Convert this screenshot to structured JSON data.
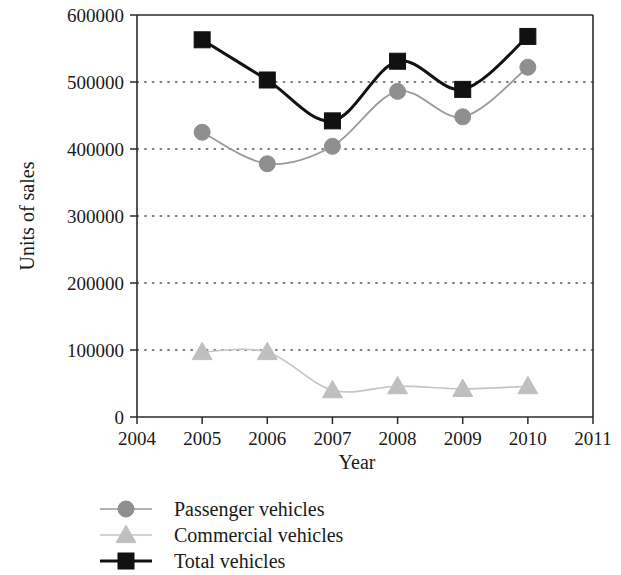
{
  "chart_data": {
    "type": "line",
    "title": "",
    "xlabel": "Year",
    "ylabel": "Units of sales",
    "x": [
      2005,
      2006,
      2007,
      2008,
      2009,
      2010
    ],
    "xticks": [
      2004,
      2005,
      2006,
      2007,
      2008,
      2009,
      2010,
      2011
    ],
    "xtick_labels": [
      "2004",
      "2005",
      "2006",
      "2007",
      "2008",
      "2009",
      "2010",
      "2011"
    ],
    "yticks": [
      0,
      100000,
      200000,
      300000,
      400000,
      500000,
      600000
    ],
    "ytick_labels": [
      "0",
      "100000",
      "200000",
      "300000",
      "400000",
      "500000",
      "600000"
    ],
    "xlim": [
      2004,
      2011
    ],
    "ylim": [
      0,
      600000
    ],
    "grid": "horizontal-dotted",
    "legend_position": "below-axes-left",
    "smoothing": "spline",
    "series": [
      {
        "name": "Passenger vehicles",
        "marker": "circle",
        "color": "#8f8f8f",
        "line_color": "#9a9a9a",
        "values": [
          425000,
          378000,
          404000,
          486000,
          448000,
          522000
        ]
      },
      {
        "name": "Commercial vehicles",
        "marker": "triangle",
        "color": "#bfbfbf",
        "line_color": "#c4c4c4",
        "values": [
          97000,
          97000,
          40000,
          46000,
          42000,
          46000
        ]
      },
      {
        "name": "Total vehicles",
        "marker": "square",
        "color": "#111111",
        "line_color": "#111111",
        "values": [
          563000,
          503000,
          442000,
          531000,
          489000,
          568000
        ]
      }
    ]
  },
  "legend": {
    "items": [
      {
        "label": "Passenger vehicles"
      },
      {
        "label": "Commercial vehicles"
      },
      {
        "label": "Total vehicles"
      }
    ]
  }
}
